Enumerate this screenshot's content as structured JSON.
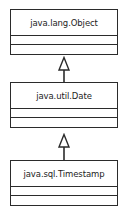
{
  "diagram": {
    "type": "uml-class-diagram",
    "background_color": "#ffffff",
    "line_color": "#2b2b2b",
    "text_color": "#1d1d1d",
    "classes": [
      {
        "id": "object",
        "name": "java.lang.Object",
        "compartments": [
          "name",
          "attributes",
          "operations"
        ],
        "attributes": [],
        "operations": []
      },
      {
        "id": "date",
        "name": "java.util.Date",
        "compartments": [
          "name",
          "attributes",
          "operations"
        ],
        "attributes": [],
        "operations": []
      },
      {
        "id": "timestamp",
        "name": "java.sql.Timestamp",
        "compartments": [
          "name",
          "attributes",
          "operations"
        ],
        "attributes": [],
        "operations": []
      }
    ],
    "relationships": [
      {
        "id": "date-to-object",
        "kind": "generalization",
        "arrowhead": "hollow-triangle",
        "source": "java.util.Date",
        "target": "java.lang.Object"
      },
      {
        "id": "timestamp-to-date",
        "kind": "generalization",
        "arrowhead": "hollow-triangle",
        "source": "java.sql.Timestamp",
        "target": "java.util.Date"
      }
    ]
  }
}
